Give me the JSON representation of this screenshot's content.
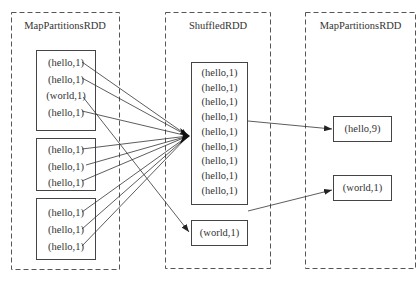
{
  "diagram": {
    "stages": [
      {
        "title": "MapPartitionsRDD",
        "partitions": [
          [
            "(hello,1)",
            "(hello,1)",
            "(world,1)",
            "(hello,1)"
          ],
          [
            "(hello,1)",
            "(hello,1)",
            "(hello,1)"
          ],
          [
            "(hello,1)",
            "(hello,1)",
            "(hello,1)"
          ]
        ]
      },
      {
        "title": "ShuffledRDD",
        "partitions": [
          [
            "(hello,1)",
            "(hello,1)",
            "(hello,1)",
            "(hello,1)",
            "(hello,1)",
            "(hello,1)",
            "(hello,1)",
            "(hello,1)",
            "(hello,1)"
          ],
          [
            "(world,1)"
          ]
        ]
      },
      {
        "title": "MapPartitionsRDD",
        "partitions": [
          [
            "(hello,9)"
          ],
          [
            "(world,1)"
          ]
        ]
      }
    ],
    "edges": [
      "all (hello,1) records -> ShuffledRDD hello partition",
      "(world,1) -> ShuffledRDD world partition",
      "ShuffledRDD hello partition -> (hello,9)",
      "ShuffledRDD world partition -> (world,1)"
    ]
  }
}
